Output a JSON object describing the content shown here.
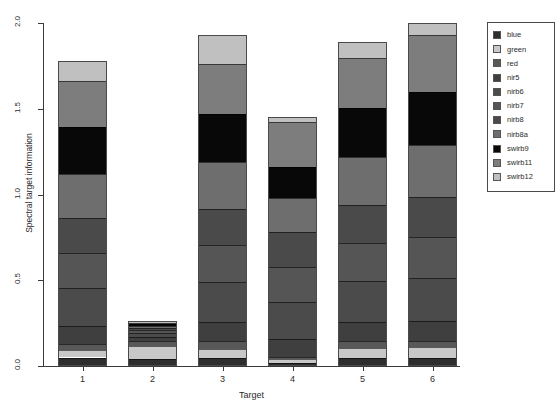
{
  "chart_data": {
    "type": "bar",
    "title": "",
    "xlabel": "Target",
    "ylabel": "Spectral target information",
    "categories": [
      "1",
      "2",
      "3",
      "4",
      "5",
      "6"
    ],
    "ylim": [
      0.0,
      2.0
    ],
    "ytick_labels": [
      "0.0",
      "0.5",
      "1.0",
      "1.5",
      "2.0"
    ],
    "ytick_values": [
      0.0,
      0.5,
      1.0,
      1.5,
      2.0
    ],
    "grid": false,
    "stacked": true,
    "legend_position": "top-right",
    "legend_entries": [
      "blue",
      "green",
      "red",
      "nir5",
      "nirb6",
      "nirb7",
      "nirb8",
      "nirb8a",
      "swirb9",
      "swirb11",
      "swirb12"
    ],
    "colors": {
      "blue": "#2e2e2e",
      "green": "#c8c8c8",
      "red": "#585858",
      "nir5": "#3f3f3f",
      "nirb6": "#4b4b4b",
      "nirb7": "#555555",
      "nirb8": "#4a4a4a",
      "nirb8a": "#6e6e6e",
      "swirb9": "#080808",
      "swirb11": "#7d7d7d",
      "swirb12": "#c0c0c0"
    },
    "series": [
      {
        "name": "blue",
        "values": [
          0.055,
          0.04,
          0.05,
          0.02,
          0.05,
          0.048
        ]
      },
      {
        "name": "green",
        "values": [
          0.048,
          0.075,
          0.06,
          0.018,
          0.058,
          0.06
        ]
      },
      {
        "name": "red",
        "values": [
          0.04,
          0.03,
          0.048,
          0.012,
          0.045,
          0.04
        ]
      },
      {
        "name": "nir5",
        "values": [
          0.115,
          0.025,
          0.125,
          0.11,
          0.12,
          0.115
        ]
      },
      {
        "name": "nirb6",
        "values": [
          0.245,
          0.02,
          0.255,
          0.215,
          0.25,
          0.25
        ]
      },
      {
        "name": "nirb7",
        "values": [
          0.23,
          0.018,
          0.24,
          0.205,
          0.235,
          0.24
        ]
      },
      {
        "name": "nirb8",
        "values": [
          0.225,
          0.015,
          0.235,
          0.2,
          0.23,
          0.235
        ]
      },
      {
        "name": "nirb8a",
        "values": [
          0.29,
          0.012,
          0.3,
          0.2,
          0.295,
          0.3
        ]
      },
      {
        "name": "swirb9",
        "values": [
          0.3,
          0.01,
          0.31,
          0.18,
          0.3,
          0.31
        ]
      },
      {
        "name": "swirb11",
        "values": [
          0.3,
          0.008,
          0.32,
          0.26,
          0.31,
          0.33
        ]
      },
      {
        "name": "swirb12",
        "values": [
          0.132,
          0.007,
          0.187,
          0.03,
          0.097,
          0.072
        ]
      }
    ],
    "totals": [
      1.78,
      0.26,
      2.13,
      1.45,
      1.99,
      2.0
    ],
    "bar_tops": [
      1.78,
      0.26,
      1.93,
      1.45,
      1.89,
      2.0
    ]
  }
}
